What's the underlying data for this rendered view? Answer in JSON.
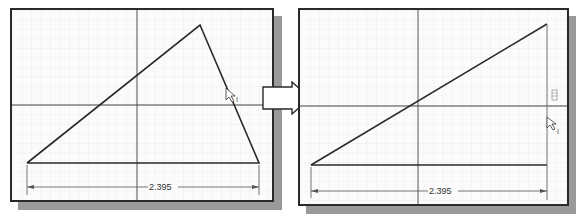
{
  "figure": {
    "arrow": "right-arrow"
  },
  "panels": [
    {
      "name": "before",
      "dimension_label": "2.395",
      "cursor_label": "I",
      "shape": "triangle"
    },
    {
      "name": "after",
      "dimension_label": "2.395",
      "cursor_label": "I",
      "constraint_glyph": "vertical-constraint",
      "shape": "right-triangle"
    }
  ],
  "colors": {
    "line": "#2a2a2a",
    "grid": "#e6e6e6",
    "axis": "#555555",
    "shadow": "#9a9a9a",
    "background": "#fbfbfb"
  }
}
